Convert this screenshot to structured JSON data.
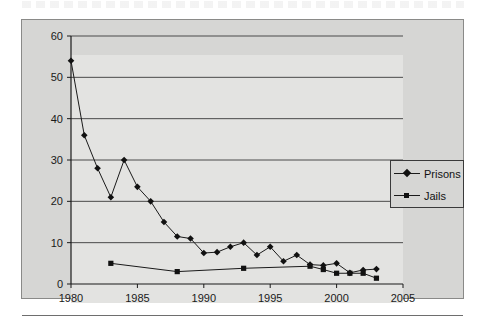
{
  "page": {
    "background_color": "#ffffff",
    "chart_panel_color": "#d6d6d4",
    "plot_area_color": "#e3e3e1",
    "line_color": "#1a1a1a",
    "footer_rule": "horizontal-rule"
  },
  "legend": {
    "position": "inside-right",
    "entries": [
      {
        "label": "Prisons",
        "marker": "diamond"
      },
      {
        "label": "Jails",
        "marker": "square"
      }
    ]
  },
  "axes": {
    "x_ticks": [
      "1980",
      "1985",
      "1990",
      "1995",
      "2000",
      "2005"
    ],
    "y_ticks": [
      "0",
      "10",
      "20",
      "30",
      "40",
      "50",
      "60"
    ]
  },
  "chart_data": {
    "type": "line",
    "title": "",
    "subtitle": "",
    "xlabel": "",
    "ylabel": "",
    "xlim": [
      1980,
      2005
    ],
    "ylim": [
      0,
      60
    ],
    "x_tick_interval": 5,
    "y_tick_interval": 10,
    "grid": "horizontal",
    "legend_position": "inside-right",
    "series": [
      {
        "name": "Prisons",
        "marker": "diamond",
        "x": [
          1980,
          1981,
          1982,
          1983,
          1984,
          1985,
          1986,
          1987,
          1988,
          1989,
          1990,
          1991,
          1992,
          1993,
          1994,
          1995,
          1996,
          1997,
          1998,
          1999,
          2000,
          2001,
          2002,
          2003
        ],
        "values": [
          54,
          36,
          28,
          21,
          30,
          23.5,
          20,
          15,
          11.5,
          11,
          7.5,
          7.7,
          9,
          10,
          7,
          9,
          5.5,
          7,
          4.7,
          4.5,
          5,
          2.7,
          3.4,
          3.6
        ]
      },
      {
        "name": "Jails",
        "marker": "square",
        "x": [
          1983,
          1988,
          1993,
          1998,
          1999,
          2000,
          2001,
          2002,
          2003
        ],
        "values": [
          5,
          3,
          3.8,
          4.3,
          3.5,
          2.6,
          2.6,
          2.6,
          1.4
        ]
      }
    ]
  }
}
